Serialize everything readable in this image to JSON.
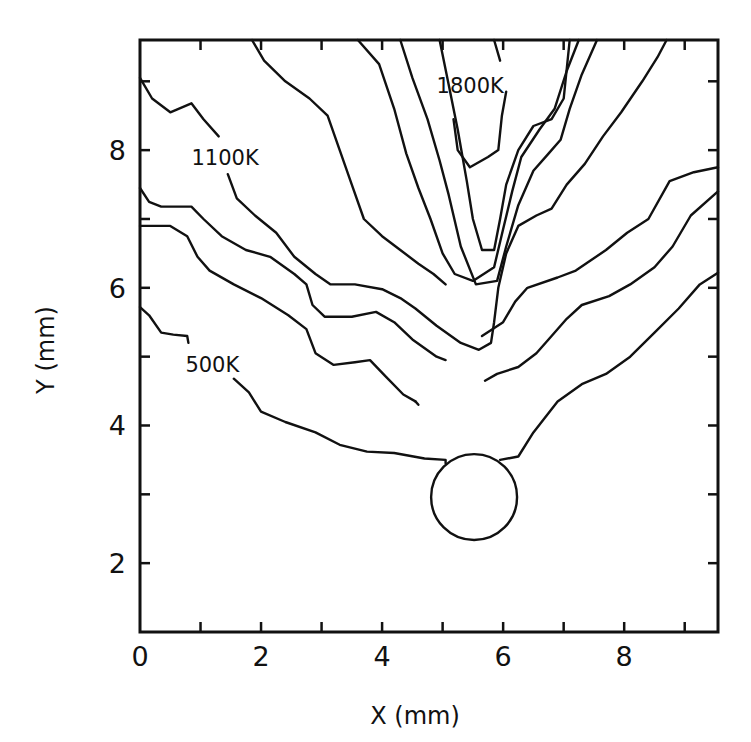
{
  "chart_data": {
    "type": "contour",
    "title": "",
    "xlabel": "X (mm)",
    "ylabel": "Y (mm)",
    "xlim": [
      0,
      9.55
    ],
    "ylim": [
      1.0,
      9.6
    ],
    "grid": false,
    "legend": null,
    "x_ticks": [
      0,
      2,
      4,
      6,
      8
    ],
    "x_minor_ticks": [
      1,
      3,
      5,
      7,
      9
    ],
    "y_ticks": [
      2,
      4,
      6,
      8
    ],
    "y_minor_ticks": [
      3,
      5,
      7,
      9
    ],
    "annotations": [
      {
        "text": "500K",
        "x": 0.75,
        "y": 4.9
      },
      {
        "text": "1100K",
        "x": 0.85,
        "y": 7.9
      },
      {
        "text": "1800K",
        "x": 4.9,
        "y": 8.95
      }
    ],
    "obstacle_circle": {
      "cx": 5.52,
      "cy": 2.96,
      "r": 0.71
    },
    "contours": [
      {
        "level": "500K (left upper fragment)",
        "points": [
          [
            0,
            5.72
          ],
          [
            0.15,
            5.6
          ],
          [
            0.35,
            5.35
          ],
          [
            0.55,
            5.32
          ],
          [
            0.78,
            5.3
          ],
          [
            0.8,
            5.2
          ]
        ]
      },
      {
        "level": "500K",
        "points": [
          [
            1.55,
            4.68
          ],
          [
            1.8,
            4.48
          ],
          [
            2.0,
            4.2
          ],
          [
            2.4,
            4.05
          ],
          [
            2.9,
            3.9
          ],
          [
            3.3,
            3.72
          ],
          [
            3.75,
            3.62
          ],
          [
            4.2,
            3.6
          ],
          [
            4.7,
            3.52
          ],
          [
            5.05,
            3.5
          ],
          [
            5.05,
            3.45
          ]
        ]
      },
      {
        "level": "500K (right of circle)",
        "points": [
          [
            5.95,
            3.5
          ],
          [
            6.25,
            3.55
          ],
          [
            6.5,
            3.9
          ],
          [
            6.9,
            4.35
          ],
          [
            7.3,
            4.6
          ],
          [
            7.7,
            4.75
          ],
          [
            8.1,
            5.0
          ],
          [
            8.5,
            5.35
          ],
          [
            8.9,
            5.7
          ],
          [
            9.25,
            6.05
          ],
          [
            9.55,
            6.22
          ]
        ]
      },
      {
        "level": "600K-a",
        "points": [
          [
            0,
            6.9
          ],
          [
            0.5,
            6.9
          ],
          [
            0.78,
            6.75
          ],
          [
            0.95,
            6.45
          ],
          [
            1.15,
            6.25
          ],
          [
            1.55,
            6.05
          ],
          [
            2.0,
            5.85
          ],
          [
            2.45,
            5.6
          ],
          [
            2.75,
            5.4
          ],
          [
            2.9,
            5.05
          ],
          [
            3.2,
            4.88
          ],
          [
            3.55,
            4.92
          ],
          [
            3.8,
            4.95
          ],
          [
            4.05,
            4.72
          ],
          [
            4.35,
            4.45
          ],
          [
            4.55,
            4.35
          ]
        ]
      },
      {
        "level": "600K-b (left of circle)",
        "points": [
          [
            4.55,
            4.35
          ],
          [
            4.6,
            4.3
          ]
        ]
      },
      {
        "level": "700K",
        "points": [
          [
            0,
            7.45
          ],
          [
            0.15,
            7.25
          ],
          [
            0.35,
            7.18
          ],
          [
            0.85,
            7.18
          ],
          [
            1.05,
            7.0
          ],
          [
            1.35,
            6.75
          ],
          [
            1.75,
            6.55
          ],
          [
            2.15,
            6.45
          ],
          [
            2.55,
            6.2
          ],
          [
            2.75,
            6.05
          ],
          [
            2.85,
            5.75
          ],
          [
            3.05,
            5.58
          ],
          [
            3.5,
            5.58
          ],
          [
            3.9,
            5.65
          ],
          [
            4.2,
            5.5
          ],
          [
            4.5,
            5.25
          ],
          [
            4.9,
            5.0
          ],
          [
            5.05,
            4.95
          ]
        ]
      },
      {
        "level": "700K (right)",
        "points": [
          [
            5.7,
            4.65
          ],
          [
            5.9,
            4.75
          ],
          [
            6.25,
            4.85
          ],
          [
            6.55,
            5.05
          ],
          [
            6.8,
            5.3
          ],
          [
            7.05,
            5.55
          ],
          [
            7.3,
            5.75
          ],
          [
            7.75,
            5.88
          ],
          [
            8.1,
            6.05
          ],
          [
            8.5,
            6.3
          ],
          [
            8.8,
            6.6
          ],
          [
            9.1,
            7.05
          ],
          [
            9.55,
            7.4
          ]
        ]
      },
      {
        "level": "800K (left)",
        "points": [
          [
            1.85,
            9.6
          ],
          [
            2.05,
            9.3
          ],
          [
            2.4,
            9.0
          ],
          [
            2.8,
            8.75
          ],
          [
            3.1,
            8.5
          ],
          [
            3.3,
            8.0
          ],
          [
            3.5,
            7.5
          ],
          [
            3.7,
            7.0
          ],
          [
            4.0,
            6.75
          ],
          [
            4.3,
            6.55
          ],
          [
            4.6,
            6.35
          ],
          [
            4.85,
            6.2
          ],
          [
            5.05,
            6.05
          ]
        ]
      },
      {
        "level": "800K (right)",
        "points": [
          [
            5.65,
            5.3
          ],
          [
            6.0,
            5.5
          ],
          [
            6.2,
            5.8
          ],
          [
            6.4,
            6.0
          ],
          [
            6.9,
            6.15
          ],
          [
            7.2,
            6.25
          ],
          [
            7.45,
            6.4
          ],
          [
            7.7,
            6.55
          ],
          [
            8.05,
            6.8
          ],
          [
            8.4,
            7.0
          ],
          [
            8.75,
            7.55
          ],
          [
            9.15,
            7.68
          ],
          [
            9.55,
            7.75
          ]
        ]
      },
      {
        "level": "900K",
        "points": [
          [
            0,
            9.05
          ],
          [
            0.2,
            8.75
          ],
          [
            0.5,
            8.55
          ],
          [
            0.85,
            8.68
          ],
          [
            1.05,
            8.45
          ],
          [
            1.3,
            8.2
          ]
        ]
      },
      {
        "level": "1100K",
        "points": [
          [
            1.45,
            7.65
          ],
          [
            1.6,
            7.3
          ],
          [
            1.9,
            7.05
          ],
          [
            2.25,
            6.8
          ],
          [
            2.55,
            6.45
          ],
          [
            2.9,
            6.2
          ],
          [
            3.15,
            6.05
          ],
          [
            3.55,
            6.05
          ],
          [
            4.0,
            5.98
          ],
          [
            4.3,
            5.85
          ],
          [
            4.55,
            5.7
          ],
          [
            4.9,
            5.45
          ],
          [
            5.3,
            5.2
          ],
          [
            5.6,
            5.1
          ],
          [
            5.8,
            5.2
          ],
          [
            5.85,
            5.5
          ],
          [
            5.92,
            6.0
          ],
          [
            6.05,
            6.5
          ],
          [
            6.25,
            6.9
          ],
          [
            6.55,
            7.05
          ],
          [
            6.8,
            7.15
          ],
          [
            7.05,
            7.5
          ],
          [
            7.35,
            7.8
          ],
          [
            7.65,
            8.2
          ],
          [
            7.95,
            8.55
          ],
          [
            8.3,
            9.0
          ],
          [
            8.55,
            9.35
          ],
          [
            8.7,
            9.6
          ]
        ]
      },
      {
        "level": "1300K",
        "points": [
          [
            4.3,
            9.6
          ],
          [
            4.5,
            9.05
          ],
          [
            4.75,
            8.45
          ],
          [
            4.95,
            7.85
          ],
          [
            5.1,
            7.35
          ],
          [
            5.3,
            6.6
          ],
          [
            5.55,
            6.05
          ],
          [
            5.9,
            6.1
          ],
          [
            6.05,
            6.6
          ],
          [
            6.25,
            7.2
          ],
          [
            6.5,
            7.7
          ],
          [
            6.75,
            7.95
          ],
          [
            6.95,
            8.15
          ],
          [
            7.1,
            8.6
          ],
          [
            7.3,
            9.1
          ],
          [
            7.55,
            9.6
          ]
        ]
      },
      {
        "level": "1500K",
        "points": [
          [
            3.6,
            9.6
          ],
          [
            3.95,
            9.25
          ],
          [
            4.2,
            8.6
          ],
          [
            4.4,
            7.95
          ],
          [
            4.6,
            7.45
          ],
          [
            4.8,
            7.0
          ],
          [
            5.0,
            6.5
          ],
          [
            5.2,
            6.2
          ],
          [
            5.5,
            6.1
          ],
          [
            5.85,
            6.3
          ],
          [
            6.0,
            6.85
          ],
          [
            6.15,
            7.4
          ],
          [
            6.3,
            7.9
          ],
          [
            6.6,
            8.3
          ],
          [
            6.85,
            8.6
          ],
          [
            7.05,
            9.15
          ],
          [
            7.25,
            9.6
          ]
        ]
      },
      {
        "level": "1700K",
        "points": [
          [
            4.95,
            9.6
          ],
          [
            5.1,
            8.95
          ],
          [
            5.25,
            8.3
          ],
          [
            5.4,
            7.55
          ],
          [
            5.5,
            7.0
          ],
          [
            5.65,
            6.55
          ],
          [
            5.85,
            6.55
          ],
          [
            5.95,
            7.0
          ],
          [
            6.05,
            7.5
          ],
          [
            6.25,
            8.0
          ],
          [
            6.5,
            8.35
          ],
          [
            6.8,
            8.45
          ],
          [
            7.0,
            8.75
          ],
          [
            7.1,
            9.6
          ]
        ]
      },
      {
        "level": "1800K",
        "points": [
          [
            5.18,
            8.45
          ],
          [
            5.25,
            8.0
          ],
          [
            5.45,
            7.75
          ],
          [
            5.75,
            7.9
          ],
          [
            5.92,
            8.0
          ],
          [
            5.98,
            8.5
          ],
          [
            6.05,
            8.85
          ]
        ]
      },
      {
        "level": "1800K (top)",
        "points": [
          [
            5.85,
            9.6
          ],
          [
            5.95,
            9.3
          ]
        ]
      }
    ]
  }
}
